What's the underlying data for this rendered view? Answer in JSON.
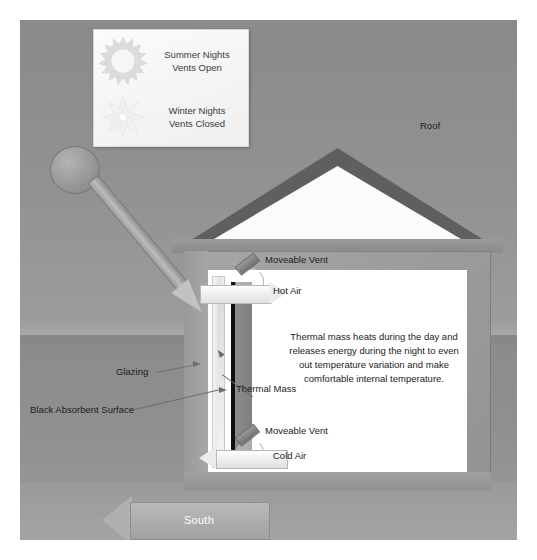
{
  "diagram": {
    "colors": {
      "canvas": "#8e8e8e",
      "sky": "#929292",
      "ground": "#8f8f8f",
      "roof": "#5f5f5f",
      "attic": "#fbfbfb",
      "wall": "#9b9b9b",
      "interior": "#ffffff",
      "absorber": "#101010",
      "thermal_mass": "#858585",
      "glazing": "#eeeeee",
      "text": "#1c1c1c",
      "south_text": "#ffffff"
    }
  },
  "legend": {
    "rows": [
      {
        "icon": "sun-icon",
        "line1": "Summer Nights",
        "line2": "Vents Open"
      },
      {
        "icon": "snowflake-icon",
        "line1": "Winter Nights",
        "line2": "Vents Closed"
      }
    ]
  },
  "labels": {
    "roof": "Roof",
    "moveable_vent_top": "Moveable Vent",
    "hot_air": "Hot Air",
    "moveable_vent_bottom": "Moveable Vent",
    "cold_air": "Cold Air",
    "glazing": "Glazing",
    "thermal_mass": "Thermal Mass",
    "black_absorbent_surface": "Black Absorbent Surface",
    "south": "South"
  },
  "body_text": {
    "thermal_mass_paragraph": "Thermal mass heats during the day and releases energy during the night to even out temperature variation and make comfortable internal temperature."
  },
  "elements": {
    "sun": "sun-disc-icon",
    "sun_ray": "solar-radiation-arrow",
    "hot_air_arrow": "hot-air-flow-arrow-right",
    "cold_air_arrow": "cold-air-flow-arrow-left",
    "cavity_arrow": "air-cavity-upflow-arrow",
    "south_arrow": "south-direction-arrow"
  }
}
